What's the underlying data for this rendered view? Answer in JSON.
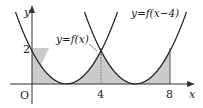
{
  "figure": {
    "curves": [
      {
        "label": "y=f(x)",
        "formula": "(x-2)^2/2",
        "vertex_x": 2
      },
      {
        "label": "y=f(x−4)",
        "formula": "(x-6)^2/2",
        "vertex_x": 6
      }
    ],
    "axes": {
      "x_label": "x",
      "y_label": "y",
      "origin_label": "O"
    },
    "ticks": {
      "x": [
        "4",
        "8"
      ],
      "y": [
        "2"
      ]
    },
    "shaded_region": {
      "from": 0,
      "to": 8
    },
    "colors": {
      "curve": "#222222",
      "shade": "#c8c8c8",
      "axis": "#333333"
    }
  }
}
